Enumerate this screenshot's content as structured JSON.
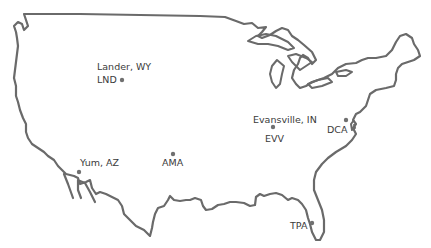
{
  "map": {
    "region": "Contiguous United States",
    "stroke_color": "#6a6a6a",
    "label_color": "#3a3a3a",
    "locations": [
      {
        "id": "lnd",
        "city_label": "Lander, WY",
        "code": "LND"
      },
      {
        "id": "evv",
        "city_label": "Evansville, IN",
        "code": "EVV"
      },
      {
        "id": "dca",
        "code": "DCA"
      },
      {
        "id": "yum",
        "city_label": "Yum, AZ"
      },
      {
        "id": "ama",
        "code": "AMA"
      },
      {
        "id": "tpa",
        "code": "TPA"
      }
    ]
  }
}
